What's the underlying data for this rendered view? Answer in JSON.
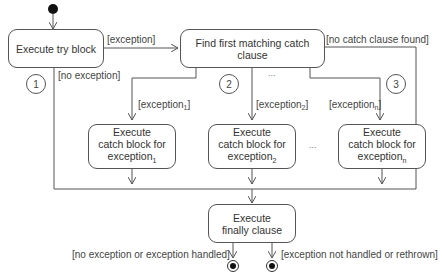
{
  "diagram": {
    "type": "UML activity diagram - exception handling (try/catch/finally)",
    "nodes": {
      "try_block": "Execute try block",
      "find_catch": "Find first matching catch clause",
      "catch1": [
        "Execute",
        "catch block for",
        "exception",
        "1"
      ],
      "catch2": [
        "Execute",
        "catch block for",
        "exception",
        "2"
      ],
      "catchn": [
        "Execute",
        "catch block for",
        "exception",
        "n"
      ],
      "finally": [
        "Execute",
        "finally clause"
      ]
    },
    "guards": {
      "exception": "[exception]",
      "no_exception": "[no exception]",
      "no_catch_found": "[no catch clause found]",
      "exception1": [
        "[exception",
        "1",
        "]"
      ],
      "exception2": [
        "[exception",
        "2",
        "]"
      ],
      "exceptionn": [
        "[exception",
        "n",
        "]"
      ],
      "handled": "[no exception or exception handled]",
      "not_handled": "[exception not handled or rethrown]"
    },
    "markers": [
      "1",
      "2",
      "3"
    ],
    "ellipsis": "..."
  }
}
